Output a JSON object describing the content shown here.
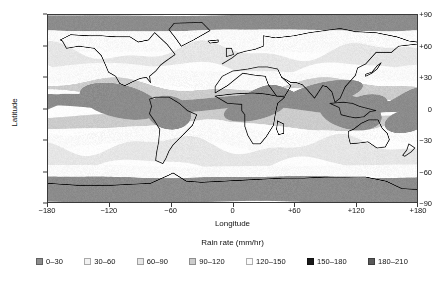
{
  "chart_data": {
    "type": "heatmap",
    "title": "",
    "xlabel": "Longitude",
    "ylabel": "Latitude",
    "xlim": [
      -180,
      180
    ],
    "ylim": [
      -90,
      90
    ],
    "xticks": [
      "−180",
      "−120",
      "−60",
      "0",
      "+60",
      "+120",
      "+180"
    ],
    "xtick_values": [
      -180,
      -120,
      -60,
      0,
      60,
      120,
      180
    ],
    "yticks": [
      "+90",
      "+60",
      "+30",
      "0",
      "−30",
      "−60",
      "−90"
    ],
    "ytick_values": [
      90,
      60,
      30,
      0,
      -30,
      -60,
      -90
    ],
    "grid": false,
    "legend_position": "bottom",
    "colorbar_title": "Rain rate (mm/hr)",
    "units": "mm/hr",
    "classes": [
      {
        "label": "0–30",
        "min": 0,
        "max": 30,
        "color": "#8c8c8c"
      },
      {
        "label": "30–60",
        "min": 30,
        "max": 60,
        "color": "#f2f2f2"
      },
      {
        "label": "60–90",
        "min": 60,
        "max": 90,
        "color": "#e6e6e6"
      },
      {
        "label": "90–120",
        "min": 90,
        "max": 120,
        "color": "#cccccc"
      },
      {
        "label": "120–150",
        "min": 120,
        "max": 150,
        "color": "#fafafa"
      },
      {
        "label": "150–180",
        "min": 150,
        "max": 180,
        "color": "#1a1a1a"
      },
      {
        "label": "180–210",
        "min": 180,
        "max": 210,
        "color": "#595959"
      }
    ],
    "zonal_bands": [
      {
        "lat_from": 90,
        "lat_to": 75,
        "class_index": 0,
        "description": "arctic polar band"
      },
      {
        "lat_from": 75,
        "lat_to": 55,
        "class_index": 4,
        "description": "high northern latitudes"
      },
      {
        "lat_from": 55,
        "lat_to": 38,
        "class_index": 2,
        "description": "northern storm track"
      },
      {
        "lat_from": 38,
        "lat_to": 22,
        "class_index": 4,
        "description": "northern subtropical dry zone"
      },
      {
        "lat_from": 22,
        "lat_to": 12,
        "class_index": 3,
        "description": "northern subtropics"
      },
      {
        "lat_from": 12,
        "lat_to": -4,
        "class_index": 0,
        "description": "ITCZ heavy rain band"
      },
      {
        "lat_from": -4,
        "lat_to": -18,
        "class_index": 3,
        "description": "southern tropics"
      },
      {
        "lat_from": -18,
        "lat_to": -35,
        "class_index": 4,
        "description": "southern subtropical dry zone"
      },
      {
        "lat_from": -35,
        "lat_to": -55,
        "class_index": 2,
        "description": "southern storm track"
      },
      {
        "lat_from": -55,
        "lat_to": -66,
        "class_index": 4,
        "description": "southern ocean"
      },
      {
        "lat_from": -66,
        "lat_to": -90,
        "class_index": 0,
        "description": "antarctic polar band"
      }
    ],
    "hotspots": [
      {
        "name": "west-pacific-warm-pool",
        "lon": 130,
        "lat": 2,
        "class_index": 0
      },
      {
        "name": "maritime-continent",
        "lon": 115,
        "lat": -4,
        "class_index": 0
      },
      {
        "name": "bay-of-bengal",
        "lon": 88,
        "lat": 14,
        "class_index": 0
      },
      {
        "name": "amazon-basin",
        "lon": -62,
        "lat": -4,
        "class_index": 0
      },
      {
        "name": "congo-basin",
        "lon": 22,
        "lat": 0,
        "class_index": 0
      },
      {
        "name": "east-pacific-itcz",
        "lon": -110,
        "lat": 7,
        "class_index": 0
      },
      {
        "name": "spcz",
        "lon": 170,
        "lat": -12,
        "class_index": 0
      }
    ]
  },
  "axes": {
    "x": {
      "label": "Longitude"
    },
    "y": {
      "label": "Latitude"
    }
  }
}
